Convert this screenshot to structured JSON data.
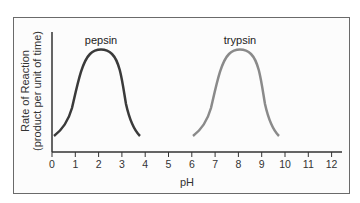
{
  "chart_data": {
    "type": "line",
    "title": "",
    "xlabel": "pH",
    "ylabel": "Rate of Reaction (product per unit of time)",
    "ylabel_lines": [
      "Rate of Reaction",
      "(product per unit of time)"
    ],
    "xlim": [
      0,
      12.5
    ],
    "x_ticks": [
      0,
      1,
      2,
      3,
      4,
      5,
      6,
      7,
      8,
      9,
      10,
      11,
      12
    ],
    "grid": false,
    "legend": "none (curves labeled directly)",
    "series": [
      {
        "name": "pepsin",
        "color": "#3a3a3a",
        "optimum_pH": 2,
        "x": [
          0.1,
          0.5,
          1.0,
          1.5,
          2.0,
          2.5,
          3.0,
          3.4,
          3.8
        ],
        "y_relative": [
          0.15,
          0.3,
          0.72,
          0.96,
          1.0,
          0.95,
          0.6,
          0.3,
          0.15
        ]
      },
      {
        "name": "trypsin",
        "color": "#8a8a8a",
        "optimum_pH": 8,
        "x": [
          6.1,
          6.5,
          7.0,
          7.5,
          8.0,
          8.5,
          9.0,
          9.4,
          9.8
        ],
        "y_relative": [
          0.15,
          0.3,
          0.72,
          0.96,
          1.0,
          0.95,
          0.6,
          0.3,
          0.15
        ]
      }
    ]
  },
  "labels": {
    "pepsin": "pepsin",
    "trypsin": "trypsin",
    "xlabel": "pH",
    "ylabel_line1": "Rate of Reaction",
    "ylabel_line2": "(product per unit of time)",
    "ticks": [
      "0",
      "1",
      "2",
      "3",
      "4",
      "5",
      "6",
      "7",
      "8",
      "9",
      "10",
      "11",
      "12"
    ]
  }
}
